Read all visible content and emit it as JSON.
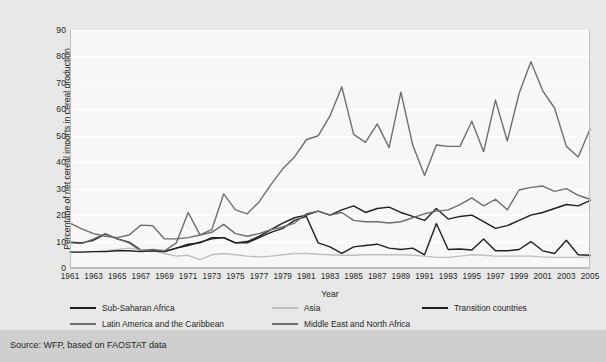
{
  "source": {
    "text": "Source: WFP, based on FAOSTAT data"
  },
  "chart_data": {
    "type": "line",
    "title": "",
    "xlabel": "Year",
    "ylabel": "Percentage of net cereal imports in cereal production",
    "xlim": [
      1961,
      2005
    ],
    "ylim": [
      0,
      90
    ],
    "yticks": [
      0,
      10,
      20,
      30,
      40,
      50,
      60,
      70,
      80,
      90
    ],
    "xticks": [
      1961,
      1963,
      1965,
      1967,
      1969,
      1971,
      1973,
      1975,
      1977,
      1979,
      1981,
      1983,
      1985,
      1987,
      1989,
      1991,
      1993,
      1995,
      1997,
      1999,
      2001,
      2003,
      2005
    ],
    "grid": true,
    "legend_position": "bottom",
    "x": [
      1961,
      1962,
      1963,
      1964,
      1965,
      1966,
      1967,
      1968,
      1969,
      1970,
      1971,
      1972,
      1973,
      1974,
      1975,
      1976,
      1977,
      1978,
      1979,
      1980,
      1981,
      1982,
      1983,
      1984,
      1985,
      1986,
      1987,
      1988,
      1989,
      1990,
      1991,
      1992,
      1993,
      1994,
      1995,
      1996,
      1997,
      1998,
      1999,
      2000,
      2001,
      2002,
      2003,
      2004,
      2005
    ],
    "series": [
      {
        "name": "Sub-Saharan Africa",
        "color": "#231f20",
        "values": [
          9.8,
          9.5,
          10.5,
          12.8,
          11.0,
          9.8,
          6.8,
          6.5,
          6.2,
          7.5,
          8.5,
          9.8,
          11.0,
          11.5,
          9.5,
          10.0,
          12.0,
          14.5,
          17.0,
          19.0,
          20.0,
          21.5,
          20.0,
          22.0,
          23.5,
          21.0,
          22.5,
          23.0,
          21.0,
          19.5,
          18.0,
          22.5,
          18.5,
          19.5,
          20.0,
          17.5,
          15.0,
          16.0,
          18.0,
          20.0,
          21.0,
          22.5,
          24.0,
          23.5,
          25.5
        ]
      },
      {
        "name": "Asia",
        "color": "#bfbfbf",
        "values": [
          6.0,
          6.0,
          6.2,
          6.5,
          7.0,
          7.5,
          7.0,
          6.5,
          5.5,
          4.5,
          4.8,
          3.2,
          5.0,
          5.5,
          5.0,
          4.5,
          4.2,
          4.5,
          5.0,
          5.5,
          5.5,
          5.2,
          5.0,
          4.8,
          4.8,
          5.0,
          5.0,
          5.0,
          5.0,
          4.8,
          4.5,
          4.0,
          4.0,
          4.5,
          5.0,
          4.8,
          4.5,
          4.5,
          4.5,
          4.5,
          4.2,
          4.0,
          4.0,
          4.0,
          4.2
        ]
      },
      {
        "name": "Transition countries",
        "color": "#231f20",
        "values": [
          6.0,
          6.0,
          6.2,
          6.2,
          6.5,
          6.5,
          6.2,
          6.5,
          6.2,
          7.5,
          9.0,
          9.5,
          11.5,
          11.5,
          9.5,
          9.5,
          11.5,
          13.5,
          15.0,
          18.0,
          19.5,
          9.5,
          8.0,
          5.5,
          8.0,
          8.5,
          9.0,
          7.5,
          7.0,
          7.5,
          5.0,
          16.8,
          7.0,
          7.2,
          6.8,
          11.0,
          6.5,
          6.5,
          7.0,
          10.0,
          6.5,
          5.5,
          10.5,
          5.0,
          4.8
        ]
      },
      {
        "name": "Latin America and the Caribbean",
        "color": "#6e6e6e",
        "values": [
          17.0,
          14.8,
          13.0,
          12.0,
          11.5,
          12.5,
          16.2,
          16.0,
          11.0,
          11.0,
          11.5,
          12.5,
          13.5,
          16.5,
          13.0,
          12.0,
          13.0,
          14.5,
          15.5,
          17.0,
          20.5,
          21.5,
          20.0,
          21.0,
          18.0,
          17.5,
          17.5,
          17.0,
          17.5,
          19.0,
          20.5,
          21.5,
          22.0,
          24.0,
          26.5,
          23.5,
          26.0,
          22.0,
          29.5,
          30.5,
          31.0,
          29.0,
          30.0,
          27.5,
          26.0
        ]
      },
      {
        "name": "Middle East and North Africa",
        "color": "#6e6e6e",
        "values": [
          9.5,
          9.2,
          11.0,
          13.0,
          11.0,
          9.5,
          6.5,
          7.0,
          6.5,
          9.5,
          21.0,
          12.5,
          14.5,
          28.0,
          22.0,
          20.5,
          25.0,
          31.5,
          37.5,
          42.0,
          48.5,
          50.0,
          57.5,
          68.5,
          50.5,
          47.5,
          54.5,
          45.5,
          66.5,
          46.5,
          35.0,
          46.5,
          46.0,
          46.0,
          55.5,
          44.0,
          63.5,
          48.0,
          66.0,
          78.0,
          67.0,
          60.5,
          46.0,
          42.0,
          52.5
        ]
      }
    ]
  }
}
